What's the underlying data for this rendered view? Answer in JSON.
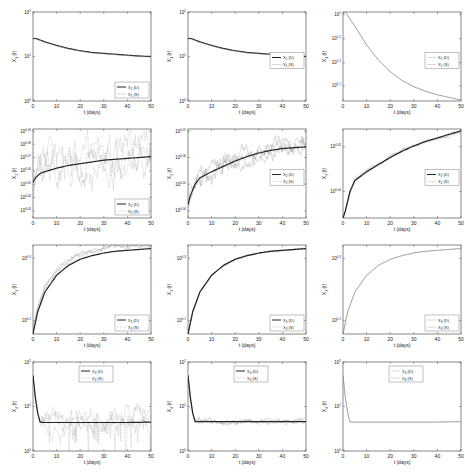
{
  "figure": {
    "rows": 4,
    "cols": 3,
    "xlabel": "t (days)",
    "xticks": [
      0,
      10,
      20,
      30,
      40,
      50
    ]
  },
  "chart_data": [
    {
      "id": "r1c1",
      "type": "line",
      "xlabel": "t (days)",
      "ylabel": "X_1 (t)",
      "yscale": "log",
      "xlim": [
        0,
        50
      ],
      "yticks": [
        "10^0",
        "10^1",
        "10^2"
      ],
      "ylim_log": [
        0,
        2
      ],
      "legend": {
        "pos": "lower-right",
        "entries": [
          "X_1 (D)",
          "X_1 (S)"
        ]
      },
      "series": [
        {
          "name": "X_1 (D)",
          "style": "thick",
          "x": [
            0,
            1,
            5,
            10,
            15,
            20,
            25,
            30,
            35,
            40,
            45,
            50
          ],
          "y_log": [
            1.4,
            1.41,
            1.33,
            1.25,
            1.18,
            1.13,
            1.09,
            1.07,
            1.05,
            1.03,
            1.01,
            1.0
          ]
        },
        {
          "name": "X_1 (S)",
          "style": "thin",
          "x": [
            0,
            1,
            5,
            10,
            15,
            20,
            25,
            30,
            35,
            40,
            45,
            50
          ],
          "y_log": [
            1.39,
            1.4,
            1.32,
            1.24,
            1.17,
            1.12,
            1.08,
            1.06,
            1.04,
            1.02,
            1.0,
            0.99
          ]
        }
      ]
    },
    {
      "id": "r1c2",
      "type": "line",
      "xlabel": "t (days)",
      "ylabel": "X_1 (t)",
      "yscale": "log",
      "xlim": [
        0,
        50
      ],
      "yticks": [
        "10^0",
        "10^1",
        "10^2"
      ],
      "ylim_log": [
        0,
        2
      ],
      "legend": {
        "pos": "mid-right",
        "entries": [
          "X_1 (D)",
          "X_1 (S)"
        ]
      },
      "series": [
        {
          "name": "X_1 (D)",
          "style": "thick",
          "x": [
            0,
            1,
            5,
            10,
            15,
            20,
            25,
            30,
            35,
            40,
            45,
            50
          ],
          "y_log": [
            1.4,
            1.41,
            1.33,
            1.25,
            1.18,
            1.13,
            1.09,
            1.07,
            1.05,
            1.03,
            1.01,
            1.0
          ]
        },
        {
          "name": "X_1 (S)",
          "style": "thin",
          "x": [
            0,
            1,
            5,
            10,
            15,
            20,
            25,
            30,
            35,
            40,
            45,
            50
          ],
          "y_log": [
            1.39,
            1.4,
            1.32,
            1.24,
            1.17,
            1.12,
            1.08,
            1.06,
            1.04,
            1.02,
            1.0,
            0.99
          ]
        }
      ]
    },
    {
      "id": "r1c3",
      "type": "line",
      "xlabel": "t (days)",
      "ylabel": "X_1 (t)",
      "yscale": "log",
      "xlim": [
        0,
        50
      ],
      "yticks": [
        "10^1",
        "10^1.5",
        "10^1.3",
        "10^1.1"
      ],
      "ytick_pos": [
        0.97,
        0.7,
        0.43,
        0.17
      ],
      "legend": {
        "pos": "mid-right",
        "entries": [
          "X_1 (D)",
          "X_1 (S)"
        ]
      },
      "series": [
        {
          "name": "X_1 (D)",
          "style": "thin",
          "x": [
            0,
            1,
            5,
            10,
            15,
            20,
            25,
            30,
            35,
            40,
            45,
            50
          ],
          "y_norm": [
            0.99,
            1.0,
            0.84,
            0.63,
            0.46,
            0.33,
            0.23,
            0.16,
            0.11,
            0.07,
            0.04,
            0.01
          ]
        },
        {
          "name": "X_1 (S)",
          "style": "thin",
          "x": [
            0,
            1,
            5,
            10,
            15,
            20,
            25,
            30,
            35,
            40,
            45,
            50
          ],
          "y_norm": [
            0.99,
            1.0,
            0.84,
            0.63,
            0.46,
            0.33,
            0.23,
            0.16,
            0.11,
            0.07,
            0.04,
            0.01
          ]
        }
      ]
    },
    {
      "id": "r2c1",
      "type": "line",
      "xlabel": "t (days)",
      "ylabel": "X_2 (t)",
      "yscale": "log",
      "xlim": [
        0,
        50
      ],
      "yticks": [
        "10^0.09",
        "10^0.08",
        "10^0.07",
        "10^0.06",
        "10^0.05",
        "10^0.04",
        "10^0.03"
      ],
      "ytick_pos": [
        0.97,
        0.83,
        0.68,
        0.53,
        0.38,
        0.23,
        0.08
      ],
      "legend": {
        "pos": "lower-right",
        "entries": [
          "X_2 (D)",
          "X_2 (S)"
        ]
      },
      "noisy": true,
      "series": [
        {
          "name": "X_2 (D)",
          "style": "thick",
          "x": [
            0,
            1,
            3,
            5,
            10,
            15,
            20,
            25,
            30,
            35,
            40,
            45,
            50
          ],
          "y_norm": [
            0.4,
            0.45,
            0.5,
            0.52,
            0.56,
            0.59,
            0.61,
            0.63,
            0.65,
            0.66,
            0.67,
            0.68,
            0.69
          ]
        },
        {
          "name": "X_2 (S)",
          "style": "noise",
          "center": "X_2 (D)",
          "amplitude": 0.25
        }
      ]
    },
    {
      "id": "r2c2",
      "type": "line",
      "xlabel": "t (days)",
      "ylabel": "X_2 (t)",
      "yscale": "log",
      "xlim": [
        0,
        50
      ],
      "yticks": [
        "10^0.07",
        "10^0.06",
        "10^0.05",
        "10^0.04"
      ],
      "ytick_pos": [
        0.97,
        0.68,
        0.38,
        0.08
      ],
      "legend": {
        "pos": "mid-right",
        "entries": [
          "X_2 (D)",
          "X_2 (S)"
        ]
      },
      "noisy": true,
      "series": [
        {
          "name": "X_2 (D)",
          "style": "thick",
          "x": [
            0,
            1,
            3,
            5,
            10,
            15,
            20,
            25,
            30,
            35,
            40,
            45,
            50
          ],
          "y_norm": [
            0.15,
            0.25,
            0.38,
            0.45,
            0.52,
            0.58,
            0.64,
            0.69,
            0.73,
            0.76,
            0.78,
            0.79,
            0.8
          ]
        },
        {
          "name": "X_2 (S)",
          "style": "noise",
          "center": "X_2 (D)",
          "amplitude": 0.12
        }
      ]
    },
    {
      "id": "r2c3",
      "type": "line",
      "xlabel": "t (days)",
      "ylabel": "X_2 (t)",
      "yscale": "log",
      "xlim": [
        0,
        50
      ],
      "yticks": [
        "10^0.05",
        "10^0.04"
      ],
      "ytick_pos": [
        0.8,
        0.3
      ],
      "legend": {
        "pos": "mid-right",
        "entries": [
          "X_2 (D)",
          "X_2 (S)"
        ]
      },
      "noisy": true,
      "series": [
        {
          "name": "X_2 (D)",
          "style": "thick",
          "x": [
            0,
            1,
            3,
            5,
            10,
            15,
            20,
            25,
            30,
            35,
            40,
            45,
            50
          ],
          "y_norm": [
            0.0,
            0.08,
            0.3,
            0.42,
            0.52,
            0.6,
            0.68,
            0.75,
            0.81,
            0.86,
            0.9,
            0.94,
            0.98
          ]
        },
        {
          "name": "X_2 (S)",
          "style": "noise",
          "center": "X_2 (D)",
          "amplitude": 0.025
        }
      ]
    },
    {
      "id": "r3c1",
      "type": "line",
      "xlabel": "t (days)",
      "ylabel": "X_3 (t)",
      "yscale": "log",
      "xlim": [
        0,
        50
      ],
      "yticks": [
        "10^0.3",
        "10^0.1"
      ],
      "ytick_pos": [
        0.85,
        0.15
      ],
      "legend": {
        "pos": "lower-right",
        "entries": [
          "X_3 (D)",
          "X_3 (S)"
        ]
      },
      "noisy": true,
      "series": [
        {
          "name": "X_3 (D)",
          "style": "thick",
          "x": [
            0,
            2,
            5,
            10,
            15,
            20,
            25,
            30,
            35,
            40,
            45,
            50
          ],
          "y_norm": [
            0.0,
            0.25,
            0.47,
            0.66,
            0.77,
            0.84,
            0.88,
            0.91,
            0.93,
            0.94,
            0.95,
            0.96
          ]
        },
        {
          "name": "X_3 (S)",
          "style": "noise",
          "center": "X_3 (D)",
          "amplitude": 0.04,
          "offset": 0.05
        }
      ]
    },
    {
      "id": "r3c2",
      "type": "line",
      "xlabel": "t (days)",
      "ylabel": "X_3 (t)",
      "yscale": "log",
      "xlim": [
        0,
        50
      ],
      "yticks": [
        "10^0.3",
        "10^0.1"
      ],
      "ytick_pos": [
        0.85,
        0.15
      ],
      "legend": {
        "pos": "lower-right",
        "entries": [
          "X_3 (D)",
          "X_3 (S)"
        ]
      },
      "noisy": true,
      "series": [
        {
          "name": "X_3 (D)",
          "style": "thick",
          "x": [
            0,
            2,
            5,
            10,
            15,
            20,
            25,
            30,
            35,
            40,
            45,
            50
          ],
          "y_norm": [
            0.0,
            0.25,
            0.47,
            0.66,
            0.77,
            0.84,
            0.88,
            0.91,
            0.93,
            0.94,
            0.95,
            0.96
          ]
        },
        {
          "name": "X_3 (S)",
          "style": "noise",
          "center": "X_3 (D)",
          "amplitude": 0.01
        }
      ]
    },
    {
      "id": "r3c3",
      "type": "line",
      "xlabel": "t (days)",
      "ylabel": "X_3 (t)",
      "yscale": "log",
      "xlim": [
        0,
        50
      ],
      "yticks": [
        "10^0.3",
        "10^0.1"
      ],
      "ytick_pos": [
        0.85,
        0.15
      ],
      "legend": {
        "pos": "lower-right",
        "entries": [
          "X_3 (D)",
          "X_3 (S)"
        ]
      },
      "series": [
        {
          "name": "X_3 (D)",
          "style": "thin",
          "x": [
            0,
            2,
            5,
            10,
            15,
            20,
            25,
            30,
            35,
            40,
            45,
            50
          ],
          "y_norm": [
            0.0,
            0.25,
            0.47,
            0.66,
            0.77,
            0.84,
            0.88,
            0.91,
            0.93,
            0.94,
            0.95,
            0.96
          ]
        },
        {
          "name": "X_3 (S)",
          "style": "thin",
          "x": [
            0,
            2,
            5,
            10,
            15,
            20,
            25,
            30,
            35,
            40,
            45,
            50
          ],
          "y_norm": [
            0.0,
            0.25,
            0.47,
            0.66,
            0.77,
            0.84,
            0.88,
            0.91,
            0.93,
            0.94,
            0.95,
            0.96
          ]
        }
      ]
    },
    {
      "id": "r4c1",
      "type": "line",
      "xlabel": "t (days)",
      "ylabel": "X_4 (t)",
      "yscale": "log",
      "xlim": [
        0,
        50
      ],
      "yticks": [
        "10^2",
        "10^1",
        "10^0"
      ],
      "ylim_log": [
        0,
        2
      ],
      "legend": {
        "pos": "upper-mid",
        "entries": [
          "X_4 (D)",
          "X_4 (S)"
        ]
      },
      "noisy": true,
      "series": [
        {
          "name": "X_4 (D)",
          "style": "thick",
          "x": [
            0,
            0.5,
            1,
            2,
            3,
            5,
            10,
            20,
            30,
            40,
            50
          ],
          "y_log": [
            1.7,
            1.45,
            1.2,
            0.85,
            0.65,
            0.64,
            0.64,
            0.64,
            0.64,
            0.64,
            0.65
          ]
        },
        {
          "name": "X_4 (S)",
          "style": "noise",
          "center": "X_4 (D)",
          "amplitude": 0.15,
          "after": 3
        }
      ]
    },
    {
      "id": "r4c2",
      "type": "line",
      "xlabel": "t (days)",
      "ylabel": "X_4 (t)",
      "yscale": "log",
      "xlim": [
        0,
        50
      ],
      "yticks": [
        "10^2",
        "10^1",
        "10^0"
      ],
      "ylim_log": [
        0,
        2
      ],
      "legend": {
        "pos": "upper-mid",
        "entries": [
          "X_4 (D)",
          "X_4 (S)"
        ]
      },
      "noisy": true,
      "series": [
        {
          "name": "X_4 (D)",
          "style": "thick",
          "x": [
            0,
            0.5,
            1,
            2,
            3,
            5,
            10,
            20,
            30,
            40,
            50
          ],
          "y_log": [
            1.7,
            1.45,
            1.2,
            0.85,
            0.66,
            0.66,
            0.66,
            0.66,
            0.66,
            0.66,
            0.66
          ]
        },
        {
          "name": "X_4 (S)",
          "style": "noise",
          "center": "X_4 (D)",
          "amplitude": 0.04,
          "after": 3
        }
      ]
    },
    {
      "id": "r4c3",
      "type": "line",
      "xlabel": "t (days)",
      "ylabel": "X_4 (t)",
      "yscale": "log",
      "xlim": [
        0,
        50
      ],
      "yticks": [
        "10^2",
        "10^1",
        "10^0"
      ],
      "ylim_log": [
        0,
        2
      ],
      "legend": {
        "pos": "upper-mid",
        "entries": [
          "X_4 (D)",
          "X_4 (S)"
        ]
      },
      "series": [
        {
          "name": "X_4 (D)",
          "style": "thin",
          "x": [
            0,
            0.5,
            1,
            2,
            3,
            5,
            10,
            20,
            30,
            40,
            50
          ],
          "y_log": [
            1.7,
            1.45,
            1.2,
            0.85,
            0.65,
            0.65,
            0.65,
            0.65,
            0.65,
            0.65,
            0.66
          ]
        },
        {
          "name": "X_4 (S)",
          "style": "thin",
          "x": [
            0,
            0.5,
            1,
            2,
            3,
            5,
            10,
            20,
            30,
            40,
            50
          ],
          "y_log": [
            1.7,
            1.45,
            1.2,
            0.85,
            0.65,
            0.65,
            0.65,
            0.65,
            0.65,
            0.65,
            0.66
          ]
        }
      ]
    }
  ]
}
